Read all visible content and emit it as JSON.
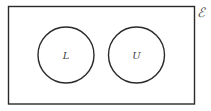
{
  "diagram": {
    "type": "venn",
    "universal_set": {
      "label": "ℰ"
    },
    "sets": [
      {
        "label": "L",
        "cx": 66,
        "cy": 55,
        "r": 28
      },
      {
        "label": "U",
        "cx": 136.5,
        "cy": 55,
        "r": 28
      }
    ],
    "relationship": "disjoint",
    "colors": {
      "stroke": "#2a2a2a",
      "label": "#444444",
      "background": "#ffffff"
    }
  }
}
